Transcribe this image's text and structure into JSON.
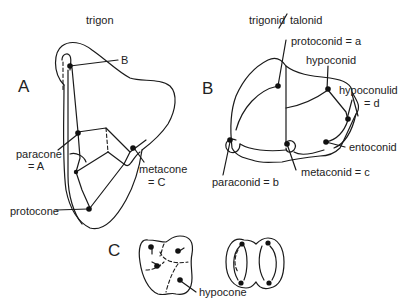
{
  "figure": {
    "panel_a": {
      "letter": "A",
      "title": "trigon",
      "labels": {
        "b": "B",
        "paracone_1": "paracone",
        "paracone_2": "= A",
        "metacone_1": "metacone",
        "metacone_2": "= C",
        "protocone": "protocone"
      }
    },
    "panel_b": {
      "letter": "B",
      "title_left": "trigonid",
      "title_sep": "/",
      "title_right": "talonid",
      "labels": {
        "protoconid": "protoconid = a",
        "hypoconid": "hypoconid",
        "hypoconulid_1": "hypoconulid",
        "hypoconulid_2": "= d",
        "entoconid": "entoconid",
        "metaconid": "metaconid = c",
        "paraconid": "paraconid = b"
      }
    },
    "panel_c": {
      "letter": "C",
      "labels": {
        "hypocone": "hypocone"
      }
    },
    "colors": {
      "ink": "#1a1a1a",
      "background": "#ffffff"
    }
  }
}
